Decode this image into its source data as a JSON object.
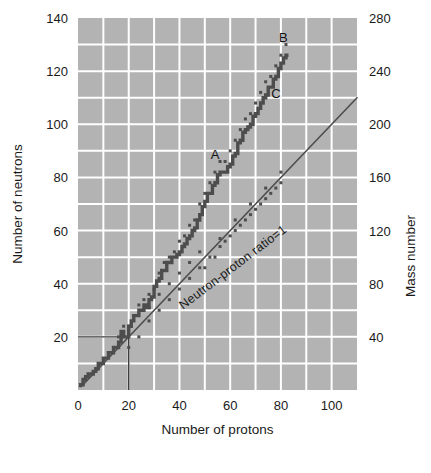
{
  "chart_data": {
    "type": "scatter",
    "title": "",
    "xlabel": "Number of protons",
    "ylabel": "Number of neutrons",
    "y2label": "Mass number",
    "xlim": [
      0,
      110
    ],
    "ylim": [
      0,
      140
    ],
    "y2lim": [
      0,
      280
    ],
    "xticks": [
      0,
      20,
      40,
      60,
      80,
      100
    ],
    "yticks": [
      0,
      20,
      40,
      60,
      80,
      100,
      120,
      140
    ],
    "y2ticks": [
      40,
      80,
      120,
      160,
      200,
      240,
      280
    ],
    "xtick_labels": [
      "0",
      "20",
      "40",
      "60",
      "80",
      "100"
    ],
    "ytick_labels": [
      "20",
      "40",
      "60",
      "80",
      "100",
      "120",
      "140"
    ],
    "y2tick_labels": [
      "40",
      "80",
      "120",
      "160",
      "200",
      "240",
      "280"
    ],
    "grid": true,
    "grid_color": "#ffffff",
    "plot_bg": "#b3b3b3",
    "band_color": "#4d4d4d",
    "line_color": "#4d4d4d",
    "legend": "none",
    "annotations": [
      {
        "text": "A",
        "x": 54,
        "y": 87,
        "note": "label on band, mid-region"
      },
      {
        "text": "B",
        "x": 81,
        "y": 131,
        "note": "label at upper end of band"
      },
      {
        "text": "C",
        "x": 78,
        "y": 110,
        "note": "label right of band"
      },
      {
        "text": "Neutron-proton ratio=1",
        "x": 62,
        "y": 45,
        "rotation": -37,
        "note": "label along N:Z = 1 diagonal"
      }
    ],
    "reference_line": {
      "name": "Neutron-proton ratio=1",
      "from": [
        2,
        2
      ],
      "to": [
        110,
        110
      ],
      "slope": 1
    },
    "guide_lines": [
      {
        "name": "neutron-20-guide",
        "from": [
          0,
          20
        ],
        "to": [
          20,
          20
        ]
      },
      {
        "name": "proton-20-guide",
        "from": [
          20,
          0
        ],
        "to": [
          20,
          20
        ]
      }
    ],
    "series": [
      {
        "name": "Band of stability (stable nuclides)",
        "description": "Stepped band of stable nuclide neutron counts versus proton number; deviates above N=Z line with increasing Z.",
        "x": [
          1,
          2,
          3,
          4,
          5,
          6,
          7,
          8,
          9,
          10,
          11,
          12,
          13,
          14,
          15,
          16,
          17,
          18,
          19,
          20,
          21,
          22,
          23,
          24,
          25,
          26,
          27,
          28,
          29,
          30,
          31,
          32,
          33,
          34,
          35,
          36,
          37,
          38,
          39,
          40,
          41,
          42,
          43,
          44,
          45,
          46,
          47,
          48,
          49,
          50,
          51,
          52,
          53,
          54,
          55,
          56,
          57,
          58,
          59,
          60,
          61,
          62,
          63,
          64,
          65,
          66,
          67,
          68,
          69,
          70,
          71,
          72,
          73,
          74,
          75,
          76,
          77,
          78,
          79,
          80,
          81,
          82,
          83
        ],
        "y": [
          1,
          2,
          4,
          5,
          6,
          6,
          7,
          8,
          10,
          10,
          12,
          12,
          14,
          14,
          16,
          16,
          18,
          22,
          20,
          20,
          24,
          26,
          28,
          28,
          30,
          30,
          32,
          31,
          34,
          35,
          39,
          41,
          42,
          45,
          45,
          48,
          48,
          50,
          50,
          51,
          52,
          54,
          55,
          57,
          58,
          60,
          61,
          64,
          66,
          69,
          71,
          74,
          74,
          77,
          78,
          81,
          82,
          82,
          82,
          84,
          85,
          88,
          89,
          93,
          94,
          97,
          98,
          99,
          100,
          103,
          104,
          106,
          108,
          110,
          111,
          114,
          114,
          117,
          118,
          121,
          123,
          125,
          126
        ],
        "marker": "square"
      },
      {
        "name": "Band scatter (additional stable isotopes)",
        "description": "Extra stable isotope points forming the width of the stability band, scattered above and below the central stepped line.",
        "x": [
          16,
          18,
          20,
          22,
          24,
          26,
          28,
          30,
          32,
          34,
          36,
          38,
          40,
          42,
          44,
          46,
          48,
          50,
          52,
          54,
          56,
          58,
          60,
          62,
          64,
          66,
          68,
          70,
          72,
          74,
          76,
          78,
          80,
          82,
          20,
          24,
          28,
          32,
          36,
          40,
          44,
          48,
          52,
          56,
          60,
          64,
          68,
          72,
          76,
          80,
          50,
          54,
          58,
          62,
          66,
          70,
          74,
          78,
          56,
          62,
          68,
          74,
          80,
          48,
          44,
          40,
          36,
          32,
          28
        ],
        "y": [
          20,
          24,
          24,
          28,
          32,
          34,
          36,
          38,
          44,
          48,
          50,
          52,
          56,
          58,
          62,
          64,
          70,
          74,
          78,
          82,
          86,
          86,
          90,
          94,
          98,
          102,
          104,
          108,
          112,
          116,
          118,
          122,
          126,
          130,
          16,
          20,
          26,
          30,
          34,
          38,
          42,
          46,
          50,
          54,
          58,
          62,
          66,
          70,
          74,
          78,
          46,
          50,
          56,
          60,
          64,
          68,
          72,
          76,
          57,
          64,
          70,
          76,
          82,
          52,
          48,
          44,
          40,
          36,
          31
        ],
        "marker": "square-small"
      }
    ]
  },
  "figure": {
    "plot_area": {
      "left": 78,
      "top": 18,
      "right": 357,
      "bottom": 390
    }
  }
}
